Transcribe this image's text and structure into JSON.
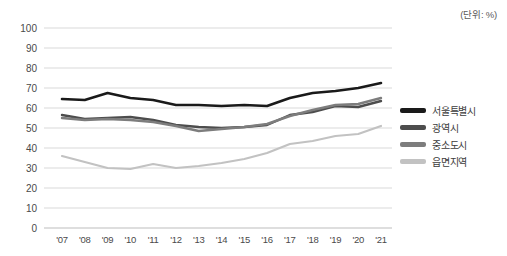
{
  "unit_note": "(단위: %)",
  "legend": {
    "position": "right",
    "items": [
      {
        "label": "서울특별시",
        "color": "#1a1a1a"
      },
      {
        "label": "광역시",
        "color": "#4d4d4d"
      },
      {
        "label": "중소도시",
        "color": "#7d7d7d"
      },
      {
        "label": "읍면지역",
        "color": "#c2c2c2"
      }
    ]
  },
  "chart_data": {
    "type": "line",
    "title": "",
    "subtitle": "",
    "xlabel": "",
    "ylabel": "",
    "unit": "(단위: %)",
    "grid": true,
    "legend_position": "right",
    "categories": [
      "'07",
      "'08",
      "'09",
      "'10",
      "'11",
      "'12",
      "'13",
      "'14",
      "'15",
      "'16",
      "'17",
      "'18",
      "'19",
      "'20",
      "'21"
    ],
    "ylim": [
      0,
      100
    ],
    "yticks": [
      0,
      10,
      20,
      30,
      40,
      50,
      60,
      70,
      80,
      90,
      100
    ],
    "series": [
      {
        "name": "서울특별시",
        "color": "#1a1a1a",
        "width": 2.6,
        "values": [
          64.5,
          64.0,
          67.5,
          65.0,
          64.0,
          61.5,
          61.5,
          61.0,
          61.5,
          61.0,
          65.0,
          67.5,
          68.5,
          70.0,
          72.5
        ]
      },
      {
        "name": "광역시",
        "color": "#4d4d4d",
        "width": 2.4,
        "values": [
          56.5,
          54.5,
          55.0,
          55.5,
          54.0,
          51.5,
          50.5,
          50.0,
          50.5,
          51.5,
          56.5,
          58.0,
          61.0,
          60.5,
          63.5
        ]
      },
      {
        "name": "중소도시",
        "color": "#7d7d7d",
        "width": 2.4,
        "values": [
          55.0,
          54.0,
          54.5,
          54.0,
          53.0,
          51.0,
          48.5,
          49.5,
          50.5,
          52.0,
          56.0,
          59.0,
          61.5,
          62.0,
          65.0
        ]
      },
      {
        "name": "읍면지역",
        "color": "#c2c2c2",
        "width": 2.2,
        "values": [
          36.0,
          33.0,
          30.0,
          29.5,
          32.0,
          30.0,
          31.0,
          32.5,
          34.5,
          37.5,
          42.0,
          43.5,
          46.0,
          47.0,
          51.0
        ]
      }
    ]
  }
}
